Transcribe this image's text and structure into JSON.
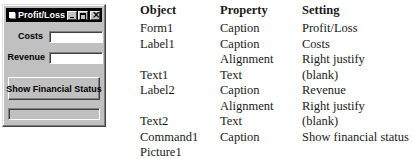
{
  "form": {
    "title": "Profit/Loss",
    "labels": {
      "costs": "Costs",
      "revenue": "Revenue"
    },
    "text1_value": "",
    "text2_value": "",
    "command_button": "Show Financial Status",
    "picture_box": ""
  },
  "properties_table": {
    "headers": {
      "object": "Object",
      "property": "Property",
      "setting": "Setting"
    },
    "rows": [
      {
        "object": "Form1",
        "property": "Caption",
        "setting": "Profit/Loss"
      },
      {
        "object": "Label1",
        "property": "Caption",
        "setting": "Costs"
      },
      {
        "object": "",
        "property": "Alignment",
        "setting": "Right justify"
      },
      {
        "object": "Text1",
        "property": "Text",
        "setting": "(blank)"
      },
      {
        "object": "Label2",
        "property": "Caption",
        "setting": "Revenue"
      },
      {
        "object": "",
        "property": "Alignment",
        "setting": "Right justify"
      },
      {
        "object": "Text2",
        "property": "Text",
        "setting": "(blank)"
      },
      {
        "object": "Command1",
        "property": "Caption",
        "setting": "Show financial status"
      },
      {
        "object": "Picture1",
        "property": "",
        "setting": ""
      }
    ]
  }
}
